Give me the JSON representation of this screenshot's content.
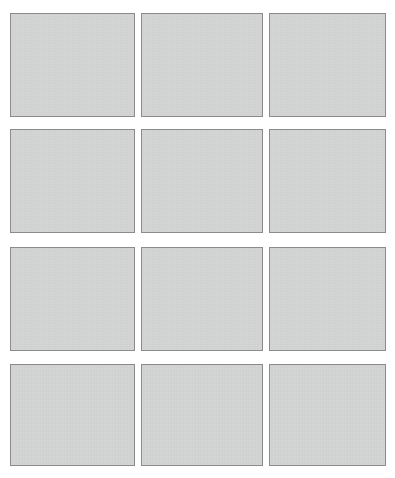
{
  "canvas": {
    "width": 395,
    "height": 478,
    "background_color": "#ffffff"
  },
  "grid": {
    "columns": 3,
    "rows": 4,
    "tile_count": 12,
    "horizontal_gap_px": 7,
    "vertical_gap_px": 11,
    "tile_fill_color": "#d3d4d4",
    "tile_border_color": "#8b8b8b",
    "tile_border_width_px": 1
  },
  "tiles": [
    {
      "id": "tile-r1-c1",
      "row": 1,
      "column": 1,
      "label": "",
      "state": "empty"
    },
    {
      "id": "tile-r1-c2",
      "row": 1,
      "column": 2,
      "label": "",
      "state": "empty"
    },
    {
      "id": "tile-r1-c3",
      "row": 1,
      "column": 3,
      "label": "",
      "state": "empty"
    },
    {
      "id": "tile-r2-c1",
      "row": 2,
      "column": 1,
      "label": "",
      "state": "empty"
    },
    {
      "id": "tile-r2-c2",
      "row": 2,
      "column": 2,
      "label": "",
      "state": "empty"
    },
    {
      "id": "tile-r2-c3",
      "row": 2,
      "column": 3,
      "label": "",
      "state": "empty"
    },
    {
      "id": "tile-r3-c1",
      "row": 3,
      "column": 1,
      "label": "",
      "state": "empty"
    },
    {
      "id": "tile-r3-c2",
      "row": 3,
      "column": 2,
      "label": "",
      "state": "empty"
    },
    {
      "id": "tile-r3-c3",
      "row": 3,
      "column": 3,
      "label": "",
      "state": "empty"
    },
    {
      "id": "tile-r4-c1",
      "row": 4,
      "column": 1,
      "label": "",
      "state": "empty"
    },
    {
      "id": "tile-r4-c2",
      "row": 4,
      "column": 2,
      "label": "",
      "state": "empty"
    },
    {
      "id": "tile-r4-c3",
      "row": 4,
      "column": 3,
      "label": "",
      "state": "empty"
    }
  ]
}
